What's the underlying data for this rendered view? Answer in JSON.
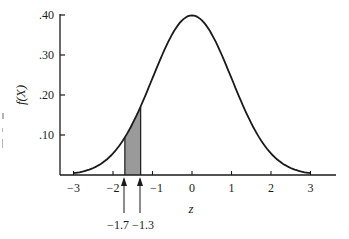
{
  "chart_data": {
    "type": "area",
    "title": "",
    "xlabel": "z",
    "ylabel": "f(X)",
    "xlim": [
      -3,
      3
    ],
    "ylim": [
      0,
      0.4
    ],
    "x_ticks": [
      -3,
      -2,
      -1,
      0,
      1,
      2,
      3
    ],
    "x_tick_labels": [
      "−3",
      "−2",
      "−1",
      "0",
      "1",
      "2",
      "3"
    ],
    "y_ticks": [
      0.1,
      0.2,
      0.3,
      0.4
    ],
    "y_tick_labels": [
      ".10",
      ".20",
      ".30",
      ".40"
    ],
    "grid": false,
    "legend": null,
    "series": [
      {
        "name": "standard normal pdf",
        "x": [
          -3.0,
          -2.5,
          -2.0,
          -1.7,
          -1.5,
          -1.3,
          -1.0,
          -0.5,
          0.0,
          0.5,
          1.0,
          1.5,
          2.0,
          2.5,
          3.0
        ],
        "values": [
          0.004,
          0.018,
          0.054,
          0.094,
          0.13,
          0.171,
          0.242,
          0.352,
          0.399,
          0.352,
          0.242,
          0.13,
          0.054,
          0.018,
          0.004
        ]
      }
    ],
    "shaded_region": {
      "from": -1.7,
      "to": -1.3,
      "color": "#9a9a9a"
    },
    "annotations": [
      {
        "text": "−1.7",
        "x": -1.7,
        "type": "arrow-up"
      },
      {
        "text": "−1.3",
        "x": -1.3,
        "type": "arrow-up"
      }
    ]
  },
  "labels": {
    "ylabel": "f(X)",
    "xlabel": "z",
    "ann_left": "−1.7",
    "ann_right": "−1.3"
  },
  "colors": {
    "ink": "#1a1a1a",
    "shade": "#9a9a9a",
    "background": "#ffffff"
  }
}
